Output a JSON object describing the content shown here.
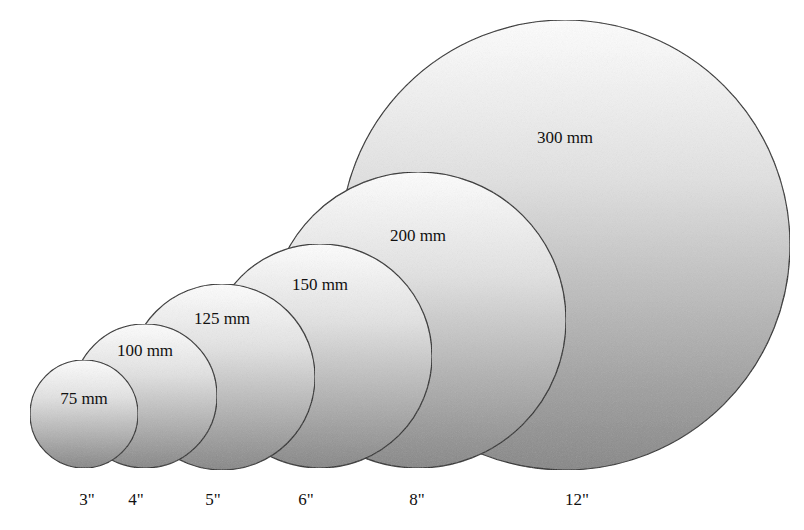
{
  "diagram": {
    "colors": {
      "fill_top": "#ffffff",
      "fill_bottom": "#8a8a8a",
      "outline": "#222222",
      "background": "#ffffff"
    },
    "wafers": [
      {
        "metric": "75 mm",
        "inch": "3\"",
        "cx": 84,
        "cy": 414,
        "r": 54,
        "label_y": 404,
        "inch_x": 87
      },
      {
        "metric": "100 mm",
        "inch": "4\"",
        "cx": 145,
        "cy": 396,
        "r": 72,
        "label_y": 356,
        "inch_x": 136
      },
      {
        "metric": "125 mm",
        "inch": "5\"",
        "cx": 222,
        "cy": 377,
        "r": 93,
        "label_y": 324,
        "inch_x": 213
      },
      {
        "metric": "150 mm",
        "inch": "6\"",
        "cx": 320,
        "cy": 356,
        "r": 112,
        "label_y": 290,
        "inch_x": 306
      },
      {
        "metric": "200 mm",
        "inch": "8\"",
        "cx": 418,
        "cy": 320,
        "r": 148,
        "label_y": 241,
        "inch_x": 417
      },
      {
        "metric": "300 mm",
        "inch": "12\"",
        "cx": 565,
        "cy": 245,
        "r": 225,
        "label_y": 143,
        "inch_x": 577
      }
    ],
    "inch_label_y": 505
  }
}
